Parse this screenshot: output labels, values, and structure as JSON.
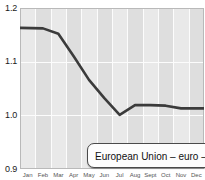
{
  "chart_data": {
    "type": "line",
    "title": "",
    "xlabel": "",
    "ylabel": "",
    "ylim": [
      0.9,
      1.2
    ],
    "yticks": [
      "0.9",
      "1.0",
      "1.1",
      "1.2"
    ],
    "ytick_values": [
      0.9,
      1.0,
      1.1,
      1.2
    ],
    "grid": true,
    "legend_position": "bottom-right",
    "categories": [
      "Jan",
      "Feb",
      "Mar",
      "Apr",
      "May",
      "Jun",
      "Jul",
      "Aug",
      "Sept",
      "Oct",
      "Nov",
      "Dec"
    ],
    "series": [
      {
        "name": "European Union – euro – €",
        "color": "#3b3b3b",
        "values": [
          1.163,
          1.162,
          1.152,
          1.11,
          1.066,
          1.032,
          1.001,
          1.019,
          1.019,
          1.018,
          1.013,
          1.013
        ]
      }
    ]
  },
  "legend": {
    "entries": [
      {
        "label": "European Union – euro – €"
      }
    ]
  },
  "axis": {
    "y_labels": [
      "1.2",
      "1.1",
      "1.0",
      "0.9"
    ],
    "x_labels": [
      "Jan",
      "Feb",
      "Mar",
      "Apr",
      "May",
      "Jun",
      "Jul",
      "Aug",
      "Sept",
      "Oct",
      "Nov",
      "Dec"
    ]
  },
  "colors": {
    "line": "#3b3b3b",
    "plot_background": "#e9e9e9",
    "band": "#dedede",
    "gridline": "#fcfcfc",
    "legend_border": "#4a4a4a",
    "text": "#1a1a1a"
  }
}
